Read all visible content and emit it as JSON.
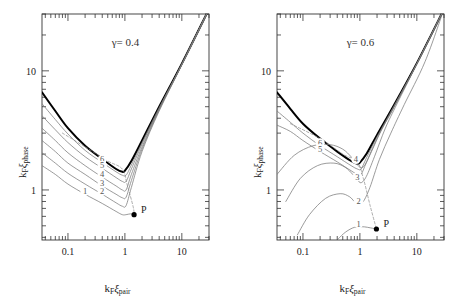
{
  "figure": {
    "background": "#ffffff",
    "panel_count": 2,
    "curve_color": "#7a7a7a",
    "envelope_color": "#000000",
    "dashed_color": "#8a8a8a",
    "axis_color": "#333333"
  },
  "axes": {
    "xlabel_main": "k",
    "xlabel_sub1": "F",
    "xlabel_xi": "ξ",
    "xlabel_sub2": "pair",
    "ylabel_main": "k",
    "ylabel_sub1": "F",
    "ylabel_xi": "ξ",
    "ylabel_sub2": "phase",
    "x_ticks": [
      "0.1",
      "1",
      "10"
    ],
    "y_ticks": [
      "1",
      "10"
    ],
    "xlim": [
      0.035,
      30
    ],
    "ylim": [
      0.38,
      30
    ],
    "xscale": "log",
    "yscale": "log",
    "grid": false
  },
  "panels": [
    {
      "id": "panel-left",
      "annotation_gamma": "γ=",
      "annotation_value": "0.4",
      "point_label": "P",
      "point_x": 1.45,
      "point_y": 0.62,
      "curve_labels": [
        "1",
        "2",
        "3",
        "4",
        "5",
        "6"
      ]
    },
    {
      "id": "panel-right",
      "annotation_gamma": "γ=",
      "annotation_value": "0.6",
      "point_label": "P",
      "point_x": 1.95,
      "point_y": 0.47,
      "curve_labels": [
        "1",
        "2",
        "3",
        "4",
        "5",
        "6"
      ]
    }
  ],
  "chart_data": {
    "type": "line",
    "title": "",
    "xlabel": "k_F xi_pair",
    "ylabel": "k_F xi_phase",
    "xscale": "log",
    "yscale": "log",
    "xlim": [
      0.035,
      30
    ],
    "ylim": [
      0.38,
      30
    ],
    "grid": false,
    "legend": "inline curve labels 1-6",
    "panels": [
      {
        "name": "gamma = 0.4",
        "annotation": "γ= 0.4",
        "marker_point": {
          "label": "P",
          "x": 1.45,
          "y": 0.62
        },
        "series": [
          {
            "name": "envelope",
            "style": "solid-thick",
            "x": [
              0.035,
              0.06,
              0.1,
              0.2,
              0.4,
              0.7,
              0.9,
              1.0,
              1.3,
              2.0,
              4.0,
              10.0,
              30.0
            ],
            "y": [
              6.6,
              4.6,
              3.3,
              2.35,
              1.82,
              1.5,
              1.42,
              1.45,
              1.75,
              2.6,
              5.0,
              11.5,
              33.0
            ]
          },
          {
            "name": "6",
            "style": "solid-thin",
            "x": [
              0.035,
              0.06,
              0.1,
              0.2,
              0.4,
              0.7,
              0.9,
              1.05,
              1.3,
              2.0,
              4.0,
              10.0,
              30.0
            ],
            "y": [
              5.3,
              3.9,
              2.95,
              2.15,
              1.7,
              1.42,
              1.33,
              1.33,
              1.62,
              2.5,
              4.9,
              11.4,
              33.0
            ]
          },
          {
            "name": "5",
            "style": "solid-thin",
            "x": [
              0.035,
              0.06,
              0.1,
              0.2,
              0.4,
              0.7,
              0.9,
              1.05,
              1.3,
              2.0,
              4.0,
              10.0,
              30.0
            ],
            "y": [
              4.2,
              3.2,
              2.5,
              1.9,
              1.52,
              1.27,
              1.18,
              1.18,
              1.5,
              2.42,
              4.85,
              11.35,
              33.0
            ]
          },
          {
            "name": "4",
            "style": "solid-thin",
            "x": [
              0.035,
              0.06,
              0.1,
              0.2,
              0.4,
              0.7,
              0.9,
              1.05,
              1.3,
              2.0,
              4.0,
              10.0,
              30.0
            ],
            "y": [
              3.3,
              2.6,
              2.05,
              1.6,
              1.28,
              1.08,
              1.0,
              1.0,
              1.35,
              2.3,
              4.75,
              11.3,
              33.0
            ]
          },
          {
            "name": "3",
            "style": "solid-thin",
            "x": [
              0.035,
              0.06,
              0.1,
              0.2,
              0.4,
              0.7,
              0.9,
              1.05,
              1.3,
              2.0,
              4.0,
              10.0,
              30.0
            ],
            "y": [
              2.6,
              2.1,
              1.68,
              1.35,
              1.08,
              0.92,
              0.86,
              0.87,
              1.2,
              2.2,
              4.7,
              11.25,
              33.0
            ]
          },
          {
            "name": "2",
            "style": "solid-thin",
            "x": [
              0.035,
              0.06,
              0.1,
              0.2,
              0.4,
              0.7,
              0.9,
              1.05,
              1.3,
              2.0,
              4.0,
              10.0,
              30.0
            ],
            "y": [
              2.05,
              1.68,
              1.38,
              1.12,
              0.92,
              0.78,
              0.73,
              0.74,
              1.05,
              2.1,
              4.6,
              11.2,
              33.0
            ]
          },
          {
            "name": "1",
            "style": "solid-thin",
            "x": [
              0.035,
              0.06,
              0.1,
              0.2,
              0.4,
              0.7,
              0.9,
              1.05,
              1.25,
              1.45
            ],
            "y": [
              1.6,
              1.35,
              1.12,
              0.92,
              0.77,
              0.66,
              0.62,
              0.62,
              0.63,
              0.62
            ]
          },
          {
            "name": "dashed",
            "style": "dashed",
            "x": [
              0.08,
              0.2,
              0.5,
              0.9,
              1.1,
              1.4,
              1.45
            ],
            "y": [
              3.0,
              2.3,
              1.75,
              1.5,
              1.1,
              0.72,
              0.62
            ]
          }
        ]
      },
      {
        "name": "gamma = 0.6",
        "annotation": "γ= 0.6",
        "marker_point": {
          "label": "P",
          "x": 1.95,
          "y": 0.47
        },
        "series": [
          {
            "name": "envelope",
            "style": "solid-thick",
            "x": [
              0.035,
              0.06,
              0.1,
              0.2,
              0.4,
              0.7,
              0.9,
              1.0,
              1.3,
              2.0,
              4.0,
              10.0,
              30.0
            ],
            "y": [
              6.6,
              4.8,
              3.6,
              2.7,
              2.1,
              1.75,
              1.66,
              1.7,
              2.0,
              2.9,
              5.2,
              11.6,
              33.0
            ]
          },
          {
            "name": "6",
            "style": "solid-thin",
            "x": [
              0.035,
              0.06,
              0.1,
              0.2,
              0.4,
              0.7,
              0.9,
              1.05,
              1.3,
              2.0,
              4.0,
              10.0,
              30.0
            ],
            "y": [
              4.6,
              3.7,
              3.0,
              2.35,
              1.9,
              1.6,
              1.5,
              1.5,
              1.85,
              2.8,
              5.1,
              11.55,
              33.0
            ]
          },
          {
            "name": "5",
            "style": "solid-thin",
            "x": [
              0.035,
              0.06,
              0.1,
              0.2,
              0.4,
              0.7,
              0.9,
              1.05,
              1.3,
              2.0,
              4.0,
              10.0,
              30.0
            ],
            "y": [
              3.5,
              3.1,
              2.6,
              2.1,
              1.72,
              1.45,
              1.35,
              1.35,
              1.7,
              2.7,
              5.05,
              11.5,
              33.0
            ]
          },
          {
            "name": "4",
            "style": "arc",
            "x": [
              0.035,
              0.07,
              0.15,
              0.3,
              0.5,
              0.7,
              0.85,
              1.0,
              1.2,
              1.6,
              2.4,
              4.0,
              10.0,
              30.0
            ],
            "y": [
              1.35,
              1.95,
              2.35,
              2.4,
              2.2,
              1.9,
              1.7,
              1.55,
              1.6,
              2.1,
              3.2,
              4.95,
              11.45,
              33.0
            ]
          },
          {
            "name": "3",
            "style": "arc",
            "x": [
              0.05,
              0.09,
              0.18,
              0.35,
              0.55,
              0.75,
              0.9,
              1.05,
              1.3,
              1.8,
              2.8,
              4.5,
              10.0,
              30.0
            ],
            "y": [
              0.8,
              1.25,
              1.6,
              1.68,
              1.55,
              1.35,
              1.22,
              1.15,
              1.3,
              1.9,
              3.3,
              5.3,
              11.4,
              33.0
            ]
          },
          {
            "name": "2",
            "style": "arc",
            "x": [
              0.08,
              0.13,
              0.25,
              0.45,
              0.65,
              0.8,
              0.95,
              1.15,
              1.5,
              2.2,
              3.5,
              6.0,
              14.0,
              30.0
            ],
            "y": [
              0.42,
              0.62,
              0.85,
              0.93,
              0.88,
              0.8,
              0.76,
              0.8,
              1.05,
              1.8,
              3.0,
              5.2,
              12.0,
              33.0
            ]
          },
          {
            "name": "1",
            "style": "arc",
            "x": [
              0.42,
              0.55,
              0.75,
              0.95,
              1.2,
              1.55,
              1.95
            ],
            "y": [
              0.39,
              0.44,
              0.48,
              0.49,
              0.49,
              0.48,
              0.47
            ]
          },
          {
            "name": "dashed",
            "style": "dashed",
            "x": [
              0.06,
              0.2,
              0.5,
              0.9,
              1.15,
              1.5,
              1.95
            ],
            "y": [
              3.6,
              2.7,
              2.0,
              1.72,
              1.25,
              0.75,
              0.47
            ]
          }
        ]
      }
    ]
  }
}
